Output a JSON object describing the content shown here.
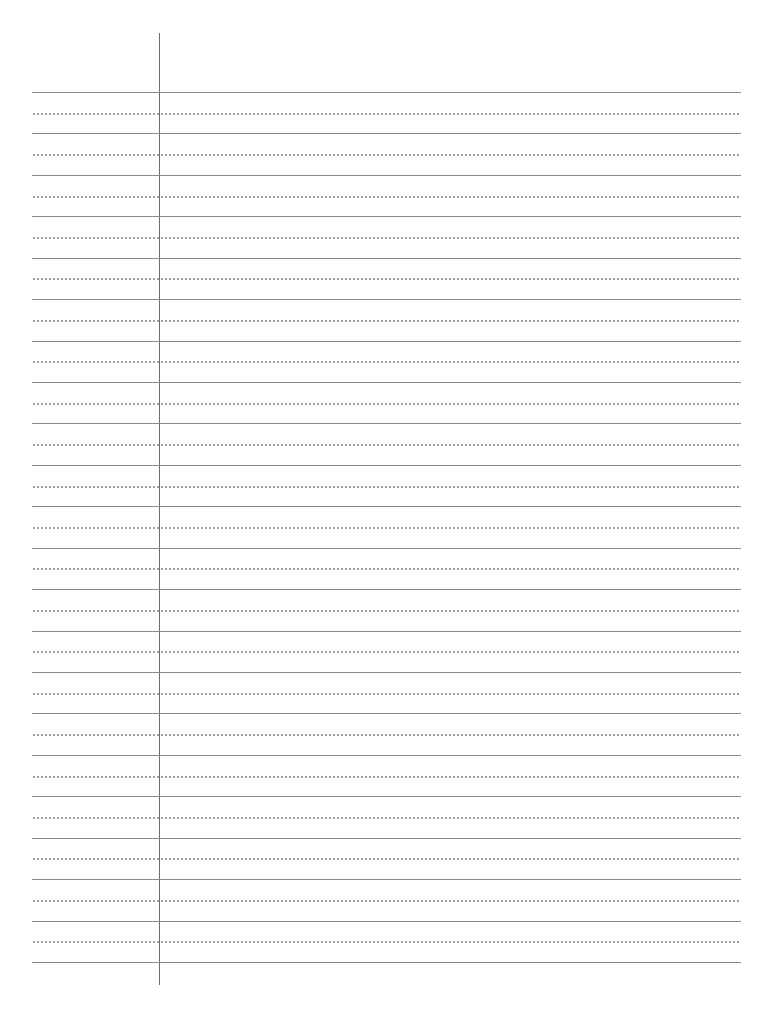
{
  "document": {
    "type": "lined-paper",
    "solid_line_count": 22,
    "dotted_line_count": 21,
    "first_line_y": 92,
    "line_spacing": 41.43,
    "margin_x": 159,
    "colors": {
      "rule": "#8a8a8a",
      "margin": "#6a6a6a",
      "dots": "#9a9a9a",
      "paper": "#ffffff"
    }
  }
}
